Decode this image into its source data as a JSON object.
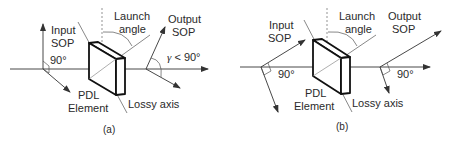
{
  "figure": {
    "panels": [
      {
        "id": "a",
        "caption": "(a)",
        "labels": {
          "input_sop_line1": "Input",
          "input_sop_line2": "SOP",
          "launch_angle_line1": "Launch",
          "launch_angle_line2": "angle",
          "output_sop_line1": "Output",
          "output_sop_line2": "SOP",
          "input_angle": "90°",
          "output_angle_symbol": "γ",
          "output_angle_rest": " < 90°",
          "pdl_line1": "PDL",
          "pdl_line2": "Element",
          "lossy_axis": "Lossy axis"
        }
      },
      {
        "id": "b",
        "caption": "(b)",
        "labels": {
          "input_sop_line1": "Input",
          "input_sop_line2": "SOP",
          "launch_angle_line1": "Launch",
          "launch_angle_line2": "angle",
          "output_sop_line1": "Output",
          "output_sop_line2": "SOP",
          "input_angle": "90°",
          "output_angle": "90°",
          "pdl_line1": "PDL",
          "pdl_line2": "Element",
          "lossy_axis": "Lossy axis"
        }
      }
    ],
    "colors": {
      "line": "#333333",
      "text": "#2a2a2a",
      "background": "#ffffff"
    }
  }
}
